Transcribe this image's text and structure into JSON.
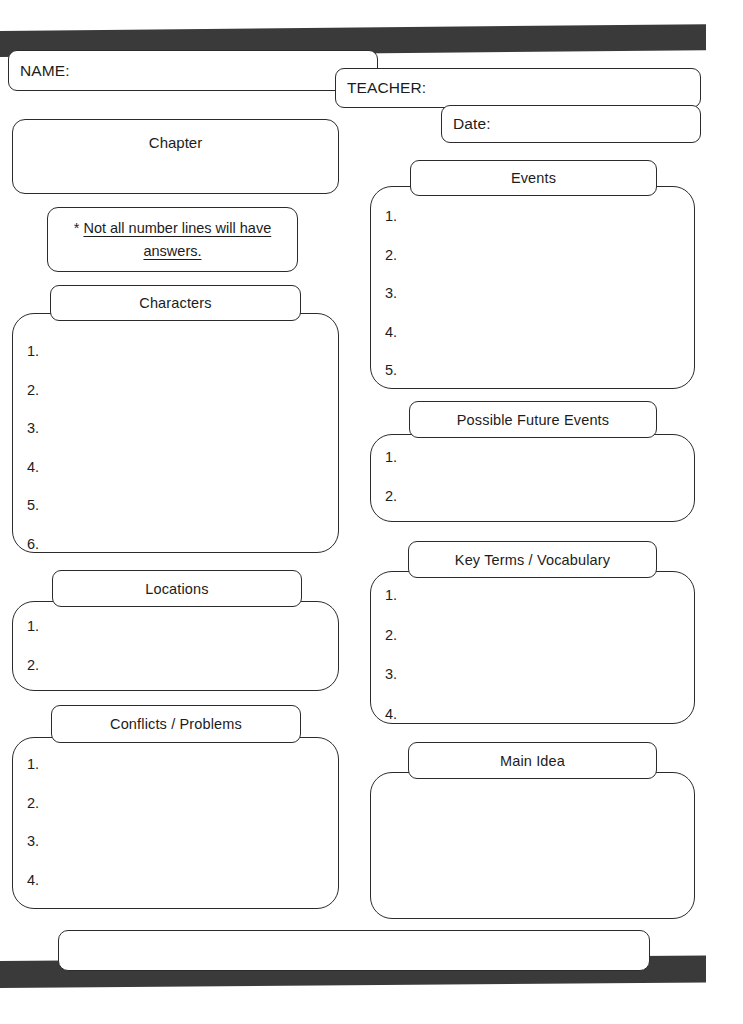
{
  "document": {
    "type": "worksheet",
    "title": "Chapter reading graphic organizer"
  },
  "header": {
    "name_label": "NAME:",
    "teacher_label": "TEACHER:",
    "date_label": "Date:"
  },
  "chapter": {
    "title": "Chapter",
    "value": ""
  },
  "note": {
    "star": "* ",
    "line1": "Not all number lines will have",
    "line2": "answers."
  },
  "sections": {
    "characters": {
      "title": "Characters",
      "lines": [
        "1.",
        "2.",
        "3.",
        "4.",
        "5.",
        "6."
      ]
    },
    "locations": {
      "title": "Locations",
      "lines": [
        "1.",
        "2."
      ]
    },
    "conflicts": {
      "title": "Conflicts / Problems",
      "lines": [
        "1.",
        "2.",
        "3.",
        "4."
      ]
    },
    "events": {
      "title": "Events",
      "lines": [
        "1.",
        "2.",
        "3.",
        "4.",
        "5."
      ]
    },
    "future_events": {
      "title": "Possible Future Events",
      "lines": [
        "1.",
        "2."
      ]
    },
    "key_terms": {
      "title": "Key Terms / Vocabulary",
      "lines": [
        "1.",
        "2.",
        "3.",
        "4."
      ]
    },
    "main_idea": {
      "title": "Main Idea",
      "lines": []
    }
  },
  "footer": {
    "value": ""
  },
  "colors": {
    "ink": "#2b2b2b",
    "text": "#1c1c1c",
    "paper": "#ffffff",
    "scan_bar": "#3a3a3a"
  }
}
